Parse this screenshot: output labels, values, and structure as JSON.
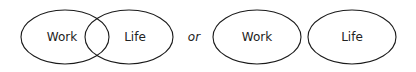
{
  "diagram": {
    "overlapping": {
      "left_label": "Work",
      "right_label": "Life"
    },
    "connector": "or",
    "separate": {
      "left_label": "Work",
      "right_label": "Life"
    },
    "colors": {
      "stroke": "#1a1a1a",
      "text": "#222222",
      "background": "#ffffff"
    }
  }
}
